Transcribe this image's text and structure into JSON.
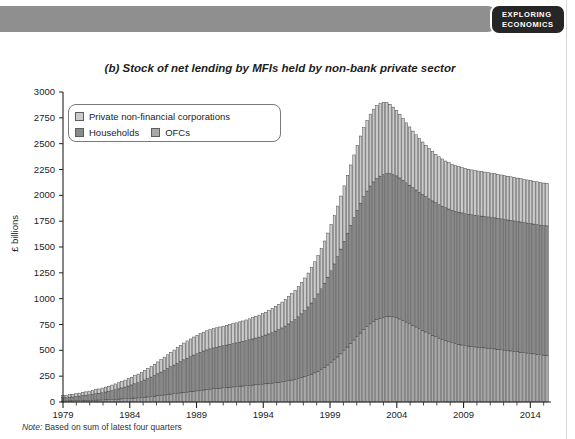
{
  "header": {
    "badge_line1": "EXPLORING",
    "badge_line2": "ECONOMICS",
    "band_color": "#8f8f8f",
    "badge_color": "#262626"
  },
  "chart_title": {
    "part": "(b)",
    "text": "Stock of net lending by MFIs held by non-bank private sector",
    "full": "(b) Stock of net lending by MFIs held by non-bank private sector"
  },
  "note": {
    "key": "Note:",
    "text": "Based on sum of latest four quarters",
    "full": "Note: Based on sum of latest four quarters"
  },
  "legend": {
    "items": [
      {
        "label": "Private non-financial corporations",
        "color": "#cbcbcb"
      },
      {
        "label": "Households",
        "color": "#8a8a8a"
      },
      {
        "label": "OFCs",
        "color": "#a8a8a8"
      }
    ]
  },
  "axes": {
    "y_label": "£ billions",
    "y_ticks": [
      "0",
      "250",
      "500",
      "750",
      "1000",
      "1250",
      "1500",
      "1750",
      "2000",
      "2250",
      "2500",
      "2750",
      "3000"
    ],
    "x_ticks": [
      "1979",
      "1984",
      "1989",
      "1994",
      "1999",
      "2004",
      "2009",
      "2014"
    ]
  },
  "chart_data": {
    "type": "bar",
    "stacked": true,
    "title": "(b) Stock of net lending by MFIs held by non-bank private sector",
    "xlabel": "",
    "ylabel": "£ billions",
    "ylim": [
      0,
      3000
    ],
    "ytick_step": 250,
    "grid": false,
    "legend_position": "top-left",
    "x_tick_labels": [
      "1979",
      "1984",
      "1989",
      "1994",
      "1999",
      "2004",
      "2009",
      "2014"
    ],
    "x_tick_years": [
      1979,
      1984,
      1989,
      1994,
      1999,
      2004,
      2009,
      2014
    ],
    "x_range": [
      1979,
      2015.25
    ],
    "series": [
      {
        "name": "OFCs",
        "color": "#a8a8a8",
        "stack_order": 1,
        "values": [
          8,
          9,
          10,
          11,
          12,
          13,
          14,
          15,
          16,
          17,
          18,
          19,
          20,
          21,
          22,
          24,
          26,
          28,
          30,
          32,
          34,
          36,
          38,
          40,
          43,
          46,
          49,
          52,
          56,
          60,
          64,
          68,
          72,
          76,
          80,
          84,
          88,
          92,
          96,
          100,
          104,
          108,
          112,
          116,
          120,
          124,
          128,
          131,
          134,
          137,
          140,
          143,
          146,
          149,
          152,
          155,
          158,
          161,
          164,
          167,
          170,
          173,
          176,
          179,
          183,
          187,
          191,
          195,
          200,
          206,
          212,
          218,
          226,
          235,
          245,
          256,
          268,
          282,
          298,
          316,
          336,
          358,
          382,
          408,
          436,
          466,
          498,
          532,
          566,
          600,
          634,
          668,
          700,
          730,
          756,
          778,
          796,
          810,
          820,
          826,
          828,
          824,
          816,
          804,
          790,
          774,
          758,
          742,
          726,
          710,
          694,
          678,
          662,
          646,
          632,
          618,
          606,
          594,
          584,
          574,
          566,
          558,
          552,
          546,
          541,
          537,
          533,
          530,
          527,
          524,
          521,
          518,
          514,
          510,
          506,
          502,
          498,
          494,
          490,
          486,
          482,
          478,
          474,
          470,
          466,
          462,
          458,
          454,
          452
        ]
      },
      {
        "name": "Households",
        "color": "#8a8a8a",
        "stack_order": 2,
        "values": [
          32,
          34,
          36,
          38,
          41,
          44,
          47,
          50,
          54,
          58,
          62,
          66,
          71,
          76,
          81,
          87,
          93,
          99,
          106,
          113,
          121,
          129,
          138,
          147,
          157,
          167,
          178,
          189,
          201,
          213,
          226,
          239,
          252,
          265,
          278,
          291,
          304,
          316,
          328,
          339,
          350,
          360,
          369,
          377,
          384,
          390,
          395,
          399,
          403,
          407,
          411,
          415,
          419,
          423,
          427,
          431,
          436,
          441,
          446,
          452,
          458,
          465,
          472,
          480,
          489,
          499,
          510,
          522,
          535,
          549,
          564,
          580,
          598,
          618,
          640,
          664,
          690,
          718,
          748,
          780,
          814,
          850,
          888,
          928,
          970,
          1014,
          1058,
          1102,
          1144,
          1184,
          1222,
          1256,
          1286,
          1312,
          1334,
          1352,
          1366,
          1376,
          1382,
          1384,
          1382,
          1378,
          1372,
          1364,
          1356,
          1348,
          1340,
          1332,
          1326,
          1320,
          1314,
          1309,
          1304,
          1300,
          1296,
          1292,
          1289,
          1286,
          1284,
          1282,
          1280,
          1279,
          1278,
          1277,
          1276,
          1275,
          1274,
          1273,
          1272,
          1271,
          1270,
          1269,
          1268,
          1267,
          1266,
          1265,
          1264,
          1263,
          1262,
          1261,
          1260,
          1259,
          1258,
          1257,
          1256,
          1255,
          1254,
          1253,
          1252
        ]
      },
      {
        "name": "Private non-financial corporations",
        "color": "#cbcbcb",
        "stack_order": 3,
        "values": [
          22,
          23,
          24,
          25,
          27,
          29,
          31,
          33,
          35,
          37,
          39,
          41,
          44,
          47,
          50,
          53,
          56,
          59,
          63,
          67,
          71,
          75,
          79,
          83,
          88,
          93,
          98,
          103,
          109,
          115,
          121,
          127,
          133,
          139,
          145,
          151,
          157,
          162,
          167,
          171,
          175,
          178,
          181,
          183,
          185,
          186,
          187,
          188,
          189,
          190,
          191,
          192,
          193,
          194,
          196,
          198,
          200,
          203,
          206,
          209,
          213,
          217,
          221,
          226,
          231,
          237,
          243,
          250,
          257,
          265,
          273,
          282,
          292,
          303,
          315,
          328,
          342,
          357,
          373,
          390,
          408,
          427,
          447,
          468,
          490,
          513,
          536,
          560,
          584,
          607,
          629,
          650,
          668,
          684,
          696,
          704,
          708,
          706,
          698,
          686,
          670,
          652,
          634,
          616,
          598,
          580,
          564,
          548,
          534,
          520,
          508,
          497,
          487,
          478,
          470,
          463,
          457,
          452,
          448,
          445,
          442,
          440,
          438,
          436,
          435,
          434,
          433,
          432,
          431,
          430,
          429,
          428,
          427,
          426,
          425,
          424,
          423,
          422,
          421,
          420,
          419,
          418,
          417,
          416,
          415,
          414,
          413,
          412,
          411
        ]
      }
    ],
    "peak": {
      "year": 2009.0,
      "total": 2790
    },
    "end": {
      "year": 2015.25,
      "total": 2115
    }
  },
  "style": {
    "axis_color": "#222222",
    "bar_edge_color": "#3a3a3a",
    "background": "#ffffff"
  }
}
